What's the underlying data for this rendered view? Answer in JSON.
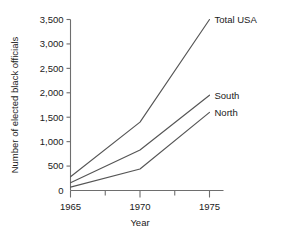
{
  "chart_data": {
    "type": "line",
    "title": "",
    "xlabel": "Year",
    "ylabel": "Number of elected black officials",
    "x": [
      1965,
      1970,
      1975
    ],
    "xtick_labels": [
      "1965",
      "1970",
      "1975"
    ],
    "ytick_labels": [
      "0",
      "500",
      "1,000",
      "1,500",
      "2,000",
      "2,500",
      "3,000",
      "3,500"
    ],
    "yticks": [
      0,
      500,
      1000,
      1500,
      2000,
      2500,
      3000,
      3500
    ],
    "ylim": [
      0,
      3500
    ],
    "xlim": [
      1965,
      1975
    ],
    "grid": false,
    "legend_position": "inline-right",
    "minor_xticks": [
      1967.5,
      1972.5
    ],
    "series": [
      {
        "name": "Total USA",
        "label": "Total USA",
        "values": [
          280,
          1400,
          3500
        ],
        "color": "#555555"
      },
      {
        "name": "South",
        "label": "South",
        "values": [
          160,
          830,
          1950
        ],
        "color": "#555555"
      },
      {
        "name": "North",
        "label": "North",
        "values": [
          70,
          440,
          1600
        ],
        "color": "#555555"
      }
    ]
  },
  "axis": {
    "color": "#6e6e6e"
  }
}
